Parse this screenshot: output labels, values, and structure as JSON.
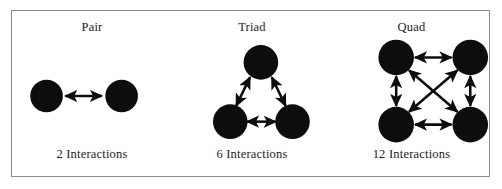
{
  "figure": {
    "border_color": "#8b8b8b",
    "background_color": "#ffffff",
    "node_color": "#0d0d0d",
    "arrow_color": "#0d0d0d"
  },
  "panels": [
    {
      "id": "pair",
      "title": "Pair",
      "caption": "2 Interactions",
      "node_count": 2,
      "interaction_count": 2
    },
    {
      "id": "triad",
      "title": "Triad",
      "caption": "6 Interactions",
      "node_count": 3,
      "interaction_count": 6
    },
    {
      "id": "quad",
      "title": "Quad",
      "caption": "12 Interactions",
      "node_count": 4,
      "interaction_count": 12
    }
  ]
}
